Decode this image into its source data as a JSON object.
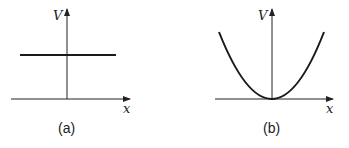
{
  "panels": [
    {
      "id": "a",
      "caption": "(a)",
      "y_axis_label": "V",
      "x_axis_label": "x",
      "curve": "constant horizontal line above x-axis"
    },
    {
      "id": "b",
      "caption": "(b)",
      "y_axis_label": "V",
      "x_axis_label": "x",
      "curve": "parabola with vertex at origin"
    }
  ],
  "colors": {
    "line": "#1a1a1a",
    "axis": "#222222"
  }
}
